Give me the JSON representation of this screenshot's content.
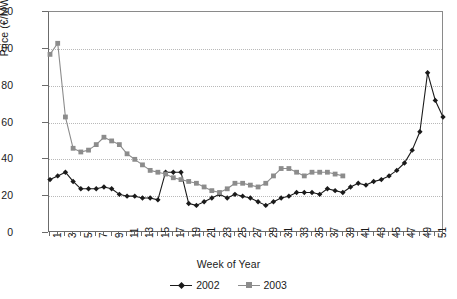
{
  "chart_data": {
    "type": "line",
    "title": "",
    "xlabel": "Week of Year",
    "ylabel": "Price (€/MWh)",
    "xlim": [
      1,
      52
    ],
    "ylim": [
      0,
      120
    ],
    "yticks": [
      0,
      20,
      40,
      60,
      80,
      100,
      120
    ],
    "xticks": [
      1,
      2,
      3,
      4,
      5,
      6,
      7,
      8,
      9,
      10,
      11,
      12,
      13,
      14,
      15,
      16,
      17,
      18,
      19,
      20,
      21,
      22,
      23,
      24,
      25,
      26,
      27,
      28,
      29,
      30,
      31,
      32,
      33,
      34,
      35,
      36,
      37,
      38,
      39,
      40,
      41,
      42,
      43,
      44,
      45,
      46,
      47,
      48,
      49,
      50,
      51,
      52
    ],
    "xtick_labels": [
      "1",
      "3",
      "5",
      "7",
      "9",
      "11",
      "13",
      "15",
      "17",
      "19",
      "21",
      "23",
      "25",
      "27",
      "29",
      "31",
      "33",
      "35",
      "37",
      "39",
      "41",
      "43",
      "45",
      "47",
      "49",
      "51"
    ],
    "grid": "horizontal-dotted",
    "legend_position": "bottom-center",
    "series": [
      {
        "name": "2002",
        "color": "#1a1a1a",
        "marker": "diamond",
        "x": [
          1,
          2,
          3,
          4,
          5,
          6,
          7,
          8,
          9,
          10,
          11,
          12,
          13,
          14,
          15,
          16,
          17,
          18,
          19,
          20,
          21,
          22,
          23,
          24,
          25,
          26,
          27,
          28,
          29,
          30,
          31,
          32,
          33,
          34,
          35,
          36,
          37,
          38,
          39,
          40,
          41,
          42,
          43,
          44,
          45,
          46,
          47,
          48,
          49,
          50,
          51,
          52
        ],
        "values": [
          29,
          31,
          33,
          28,
          24,
          24,
          24,
          25,
          24,
          21,
          20,
          20,
          19,
          19,
          18,
          33,
          33,
          33,
          16,
          15,
          17,
          19,
          21,
          19,
          21,
          20,
          19,
          17,
          15,
          17,
          19,
          20,
          22,
          22,
          22,
          21,
          24,
          23,
          22,
          25,
          27,
          26,
          28,
          29,
          31,
          34,
          38,
          45,
          55,
          87,
          72,
          63
        ]
      },
      {
        "name": "2003",
        "color": "#8c8c8c",
        "marker": "square",
        "x": [
          1,
          2,
          3,
          4,
          5,
          6,
          7,
          8,
          9,
          10,
          11,
          12,
          13,
          14,
          15,
          16,
          17,
          18,
          19,
          20,
          21,
          22,
          23,
          24,
          25,
          26,
          27,
          28,
          29,
          30,
          31,
          32,
          33,
          34,
          35,
          36,
          37,
          38,
          39
        ],
        "values": [
          97,
          103,
          63,
          46,
          44,
          45,
          48,
          52,
          50,
          48,
          43,
          40,
          37,
          34,
          33,
          32,
          30,
          29,
          28,
          27,
          25,
          23,
          22,
          24,
          27,
          27,
          26,
          25,
          27,
          31,
          35,
          35,
          33,
          31,
          33,
          33,
          33,
          32,
          31
        ]
      }
    ]
  },
  "axes": {
    "y_title": "Price (€/MWh)",
    "x_title": "Week of Year"
  },
  "legend": {
    "entries": [
      {
        "label": "2002"
      },
      {
        "label": "2003"
      }
    ]
  }
}
